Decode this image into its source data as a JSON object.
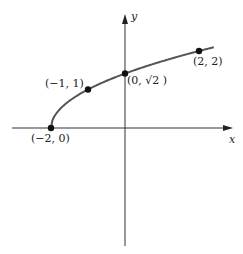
{
  "chart_data": {
    "type": "line",
    "title": "",
    "function": "y = sqrt(x + 2)",
    "xlabel": "x",
    "ylabel": "y",
    "grid": false,
    "legend": null,
    "x": [
      -2,
      -1.5,
      -1,
      -0.5,
      0,
      0.5,
      1,
      1.5,
      2,
      2.4
    ],
    "series": [
      {
        "name": "curve",
        "values": [
          0,
          0.707,
          1,
          1.225,
          1.414,
          1.581,
          1.732,
          1.871,
          2,
          2.098
        ]
      }
    ],
    "points": [
      {
        "x": -2,
        "y": 0,
        "label": "(−2, 0)"
      },
      {
        "x": -1,
        "y": 1,
        "label": "(−1, 1)"
      },
      {
        "x": 0,
        "y": 1.414,
        "label": "(0, √2 )"
      },
      {
        "x": 2,
        "y": 2,
        "label": "(2, 2)"
      }
    ],
    "xlim": [
      -3,
      2.9
    ],
    "ylim": [
      -3,
      3
    ]
  },
  "colors": {
    "axis": "#333333",
    "curve": "#555555",
    "point": "#111111"
  }
}
